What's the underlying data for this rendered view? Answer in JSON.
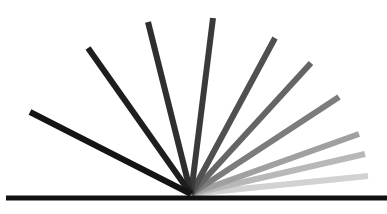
{
  "diagram": {
    "pivot": [
      191,
      194
    ],
    "baseline": {
      "x1": 6,
      "x2": 387,
      "y": 198,
      "color": "#111111"
    },
    "rays": [
      {
        "end": [
          30,
          112
        ],
        "color": "#141414"
      },
      {
        "end": [
          88,
          48
        ],
        "color": "#1e1e1e"
      },
      {
        "end": [
          148,
          22
        ],
        "color": "#2e2e2e"
      },
      {
        "end": [
          213,
          18
        ],
        "color": "#3a3a3a"
      },
      {
        "end": [
          275,
          38
        ],
        "color": "#505050"
      },
      {
        "end": [
          311,
          63
        ],
        "color": "#656565"
      },
      {
        "end": [
          339,
          97
        ],
        "color": "#7c7c7c"
      },
      {
        "end": [
          359,
          134
        ],
        "color": "#a0a0a0"
      },
      {
        "end": [
          365,
          154
        ],
        "color": "#b8b8b8"
      },
      {
        "end": [
          368,
          176
        ],
        "color": "#d2d2d2"
      }
    ]
  }
}
